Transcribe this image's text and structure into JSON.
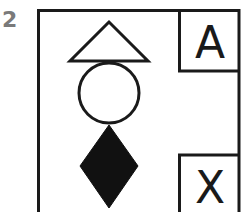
{
  "figure": {
    "number": "2",
    "corner_labels": {
      "top_right": "A",
      "bottom_right": "X"
    },
    "shapes": [
      {
        "type": "triangle",
        "fill": "outline"
      },
      {
        "type": "circle",
        "fill": "outline"
      },
      {
        "type": "diamond",
        "fill": "solid"
      }
    ],
    "colors": {
      "stroke": "#1a1a1a",
      "number": "#7a7a7a",
      "background": "#ffffff"
    }
  }
}
